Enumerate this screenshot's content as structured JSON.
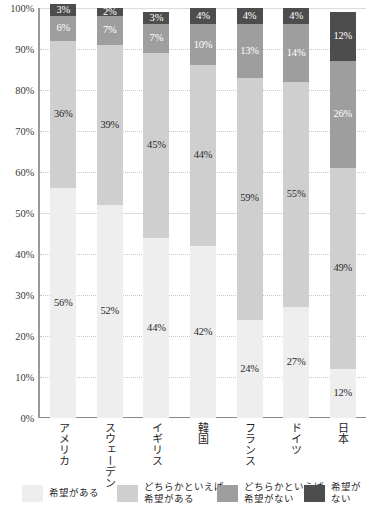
{
  "chart_data": {
    "type": "bar",
    "subtype": "stacked-bar-100-percent",
    "title": "",
    "xlabel": "",
    "ylabel": "",
    "ylim": [
      0,
      100
    ],
    "yticks": [
      "0%",
      "10%",
      "20%",
      "30%",
      "40%",
      "50%",
      "60%",
      "70%",
      "80%",
      "90%",
      "100%"
    ],
    "grid": true,
    "legend_position": "bottom",
    "categories": [
      "アメリカ",
      "スウェーデン",
      "イギリス",
      "韓国",
      "フランス",
      "ドイツ",
      "日本"
    ],
    "series": [
      {
        "name": "希望がある",
        "color": "#eeeeee",
        "label_color": "#2b2b2b",
        "values": [
          56,
          52,
          44,
          42,
          24,
          27,
          12
        ],
        "labels": [
          "56%",
          "52%",
          "44%",
          "42%",
          "24%",
          "27%",
          "12%"
        ]
      },
      {
        "name": "どちらかといえば\n希望がある",
        "color": "#cfcfcf",
        "label_color": "#2b2b2b",
        "values": [
          36,
          39,
          45,
          44,
          59,
          55,
          49
        ],
        "labels": [
          "36%",
          "39%",
          "45%",
          "44%",
          "59%",
          "55%",
          "49%"
        ]
      },
      {
        "name": "どちらかといえば\n希望がない",
        "color": "#9e9e9e",
        "label_color": "#ffffff",
        "values": [
          6,
          7,
          7,
          10,
          13,
          14,
          26
        ],
        "labels": [
          "6%",
          "7%",
          "7%",
          "10%",
          "13%",
          "14%",
          "26%"
        ]
      },
      {
        "name": "希望がない",
        "color": "#4d4d4d",
        "label_color": "#ffffff",
        "values": [
          3,
          2,
          3,
          4,
          4,
          4,
          12
        ],
        "labels": [
          "3%",
          "2%",
          "3%",
          "4%",
          "4%",
          "4%",
          "12%"
        ]
      }
    ]
  },
  "legend": {
    "items": [
      {
        "label": "希望がある",
        "color": "#eeeeee"
      },
      {
        "label": "どちらかといえば\n希望がある",
        "color": "#cfcfcf"
      },
      {
        "label": "どちらかといえば\n希望がない",
        "color": "#9e9e9e"
      },
      {
        "label": "希望がない",
        "color": "#4d4d4d"
      }
    ]
  },
  "axis": {
    "y_max_label": "100%",
    "y_min_label": "0%"
  }
}
